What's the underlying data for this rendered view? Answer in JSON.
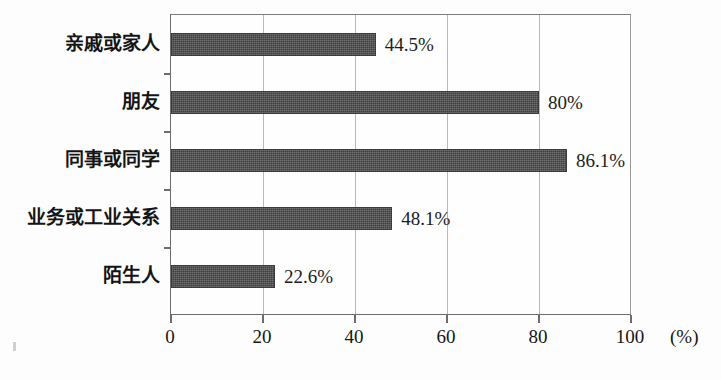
{
  "chart_data": {
    "type": "bar",
    "orientation": "horizontal",
    "title": "",
    "subtitle": "",
    "xlabel": "(%)",
    "ylabel": "",
    "categories": [
      "亲戚或家人",
      "朋友",
      "同事或同学",
      "业务或工业关系",
      "陌生人"
    ],
    "values": [
      44.5,
      80,
      86.1,
      48.1,
      22.6
    ],
    "value_labels": [
      "44.5%",
      "80%",
      "86.1%",
      "48.1%",
      "22.6%"
    ],
    "xlim": [
      0,
      100
    ],
    "xticks": [
      0,
      20,
      40,
      60,
      80,
      100
    ],
    "xtick_labels": [
      "0",
      "20",
      "40",
      "60",
      "80",
      "100"
    ],
    "grid": true,
    "grid_axis": "x",
    "legend": null,
    "legend_position": "none",
    "bar_color": "#4d4d4d",
    "bar_edge_color": "#3b3b3b",
    "axis_color": "#6d6d6d",
    "grid_color": "#b9b9b9",
    "background_color": "#fdfdfd",
    "text_color": "#141414",
    "series": [
      {
        "name": "",
        "values": [
          44.5,
          80,
          86.1,
          48.1,
          22.6
        ]
      }
    ]
  },
  "axis_unit": "(%)"
}
